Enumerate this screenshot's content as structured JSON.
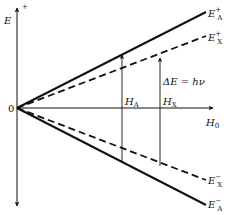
{
  "diagram": {
    "type": "zeeman-energy-level-diagram",
    "axes": {
      "vertical": {
        "label": "E",
        "superscript": "+"
      },
      "horizontal": {
        "label": "H",
        "subscript": "0"
      },
      "origin_label": "0"
    },
    "lines": [
      {
        "id": "EA_plus",
        "label": "E",
        "subscript": "A",
        "superscript": "+",
        "style": "solid"
      },
      {
        "id": "EX_plus",
        "label": "E",
        "subscript": "X",
        "superscript": "+",
        "style": "dashed"
      },
      {
        "id": "EX_minus",
        "label": "E",
        "subscript": "X",
        "superscript": "−",
        "style": "dashed"
      },
      {
        "id": "EA_minus",
        "label": "E",
        "subscript": "A",
        "superscript": "−",
        "style": "solid"
      }
    ],
    "transitions": [
      {
        "id": "HA",
        "label": "H",
        "subscript": "A"
      },
      {
        "id": "HX",
        "label": "H",
        "subscript": "X"
      }
    ],
    "equation": {
      "lhs": "ΔE",
      "eq": " = ",
      "rhs": "hν"
    }
  }
}
